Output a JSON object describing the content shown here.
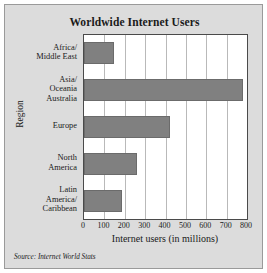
{
  "figure": {
    "background_color": "#dcdcdc",
    "plot_background_color": "#ffffff",
    "bar_color": "#808080",
    "border_color": "#4a4a4a"
  },
  "source_note": "Source: Internet World Stats",
  "chart_data": {
    "type": "bar",
    "orientation": "horizontal",
    "title": "Worldwide Internet Users",
    "xlabel": "Internet users (in millions)",
    "ylabel": "Region",
    "categories": [
      "Africa/\nMiddle East",
      "Asia/\nOceania\nAustralia",
      "Europe",
      "North\nAmerica",
      "Latin\nAmerica/\nCaribbean"
    ],
    "values": [
      145,
      780,
      420,
      260,
      185
    ],
    "xlim": [
      0,
      800
    ],
    "xticks": [
      0,
      100,
      200,
      300,
      400,
      500,
      600,
      700,
      800
    ],
    "xtick_labels": [
      "0",
      "100",
      "200",
      "300",
      "400",
      "500",
      "600",
      "700",
      "800"
    ],
    "grid": "vertical",
    "legend": null
  }
}
